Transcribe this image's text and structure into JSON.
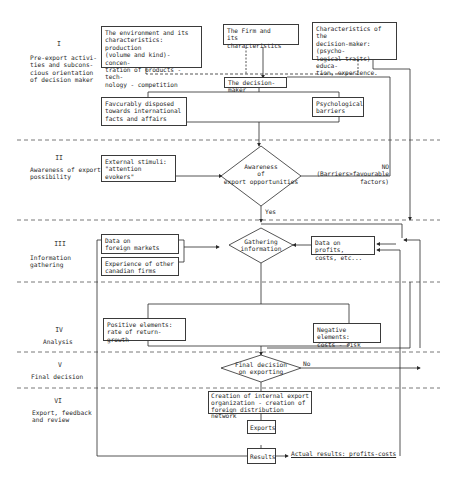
{
  "stages": [
    {
      "num": "I",
      "title": "Pre-export activi-\nties and subcons-\ncious orientation\nof decision maker"
    },
    {
      "num": "II",
      "title": "Awareness of export\npossibility"
    },
    {
      "num": "III",
      "title": "Information\ngathering"
    },
    {
      "num": "IV",
      "title": "Analysis"
    },
    {
      "num": "V",
      "title": "Final decision"
    },
    {
      "num": "VI",
      "title": "Export, feedback\nand review"
    }
  ],
  "boxes": {
    "environment": "The environment and its\ncharacteristics: production\n(volume and kind)- concen-\ntration of products - tech-\nnology - competition",
    "firm": "The Firm and\nits characteristics",
    "dm_characteristics": "Characteristics of the\ndecision-maker:(psycho-\nlogical traits) educa-\ntion, experience.",
    "decision_maker": "The decision-maker",
    "favourably_disposed": "Favcurably disposed\ntowards international\nfacts and affairs",
    "psych_barriers": "Psychological\nbarriers",
    "external_stimuli": "External stimuli:\n\"attention evokers\"",
    "foreign_markets": "Data on\nforeign markets",
    "experience_canadian": "Experience of other\ncanadian firms",
    "data_profits": "Data on profits,\ncosts, etc...",
    "positive_elements": "Positive elements:\nrate of return-growth",
    "negative_elements": "Negative elements:\ncosts - risk",
    "creation": "Creation of internal export\norganization - creation of\nforeign distribution network",
    "exports": "Exports",
    "results": "Results"
  },
  "decisions": {
    "awareness": "Awareness\nof\nexport opportunities",
    "gathering": "Gathering\ninformation",
    "final": "Final decision\non exporting"
  },
  "edge_labels": {
    "no_barriers": "NO (Barriers>favourable\nfactors)",
    "yes": "Yes",
    "no": "No",
    "actual_results": "Actual results: profits-costs"
  }
}
